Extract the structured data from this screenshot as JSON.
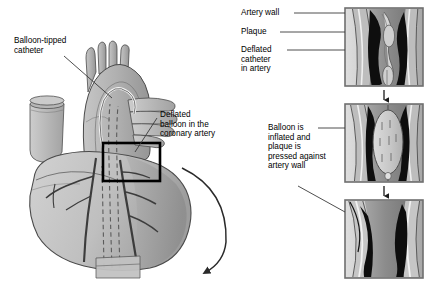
{
  "figure": {
    "left_panel": {
      "name": "heart-anatomy-view",
      "labels": [
        {
          "id": "balloon-tipped-catheter",
          "text": "Balloon-tipped\ncatheter"
        },
        {
          "id": "deflated-balloon-in-coronary-artery",
          "text": "Deflated\nballoon in the\ncoronary artery"
        }
      ],
      "highlight_box": "black rectangle over coronary artery",
      "flow_arrow": "curved arrow from heart to lower right"
    },
    "right_panel": {
      "name": "artery-sequence-panels",
      "steps": [
        {
          "index": 1,
          "name": "panel-deflated-catheter",
          "labels": [
            {
              "id": "artery-wall",
              "text": "Artery wall"
            },
            {
              "id": "plaque",
              "text": "Plaque"
            },
            {
              "id": "deflated-catheter-in-artery",
              "text": "Deflated\ncatheter\nin artery"
            }
          ]
        },
        {
          "index": 2,
          "name": "panel-inflated-balloon",
          "labels": [
            {
              "id": "balloon-inflated",
              "text": "Balloon is\ninflated and\nplaque is\npressed against\nartery wall"
            }
          ]
        },
        {
          "index": 3,
          "name": "panel-artery-opened",
          "labels": []
        }
      ],
      "step_arrows": 2
    },
    "colors": {
      "background": "#ffffff",
      "text": "#000000",
      "leader_line": "#3a3a3a",
      "heart_light": "#c9c9c9",
      "heart_mid": "#ababab",
      "heart_dark": "#8d8d8d",
      "vessel_outline": "#4a4a4a",
      "plaque": "#111111",
      "panel_border": "#6f6f6f",
      "panel_bg": "#d8d8d8",
      "artery_lumen": "#9a9a9a",
      "balloon": "#cfcfcf",
      "highlight_box": "#000000"
    }
  }
}
